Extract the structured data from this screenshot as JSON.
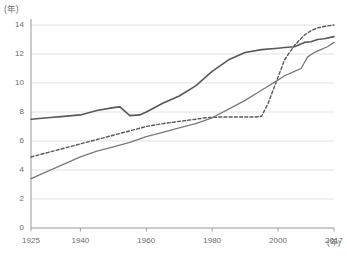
{
  "chart_data": {
    "type": "line",
    "title": "",
    "subtitle": "",
    "xlabel": "(年)",
    "ylabel": "(年)",
    "y_unit_label": "(年)",
    "x_unit_label": "(年)",
    "xlim": [
      1925,
      2017
    ],
    "ylim": [
      0,
      14
    ],
    "grid": true,
    "grid_axis": "y",
    "legend": null,
    "legend_position": "none",
    "yticks": [
      0,
      2,
      4,
      6,
      8,
      10,
      12,
      14
    ],
    "ytick_labels": [
      "0",
      "2",
      "4",
      "6",
      "8",
      "10",
      "12",
      "14"
    ],
    "xticks": [
      1925,
      1940,
      1960,
      1980,
      2000,
      2017
    ],
    "xtick_labels": [
      "1925",
      "1940",
      "1960",
      "1980",
      "2000",
      "2017"
    ],
    "colors": {
      "series_upper_solid": "#595959",
      "series_dashed": "#595959",
      "series_lower_solid": "#7a7a7a",
      "grid": "#d9d9d9",
      "axis": "#8c8c8c",
      "text": "#6b6b6b"
    },
    "series": [
      {
        "name": "upper-solid",
        "style": "solid",
        "color": "#595959",
        "width": 1.6,
        "x": [
          1925,
          1930,
          1935,
          1940,
          1945,
          1950,
          1952,
          1955,
          1958,
          1960,
          1965,
          1970,
          1975,
          1980,
          1985,
          1990,
          1995,
          2000,
          2002,
          2005,
          2008,
          2010,
          2012,
          2014,
          2017
        ],
        "values": [
          7.5,
          7.6,
          7.7,
          7.8,
          8.1,
          8.3,
          8.35,
          7.75,
          7.8,
          8.0,
          8.6,
          9.1,
          9.8,
          10.8,
          11.6,
          12.1,
          12.3,
          12.4,
          12.45,
          12.5,
          12.8,
          12.85,
          13.0,
          13.05,
          13.2
        ]
      },
      {
        "name": "dashed",
        "style": "dashed",
        "color": "#595959",
        "width": 1.4,
        "x": [
          1925,
          1930,
          1935,
          1940,
          1945,
          1950,
          1955,
          1960,
          1965,
          1970,
          1975,
          1978,
          1982,
          1985,
          1990,
          1993,
          1995,
          1997,
          2000,
          2002,
          2005,
          2008,
          2010,
          2012,
          2014,
          2017
        ],
        "values": [
          4.9,
          5.2,
          5.5,
          5.8,
          6.1,
          6.4,
          6.7,
          7.0,
          7.2,
          7.35,
          7.5,
          7.6,
          7.65,
          7.65,
          7.65,
          7.65,
          7.7,
          8.6,
          10.4,
          11.6,
          12.6,
          13.3,
          13.6,
          13.8,
          13.9,
          14.0
        ]
      },
      {
        "name": "lower-solid",
        "style": "solid",
        "color": "#7a7a7a",
        "width": 1.3,
        "x": [
          1925,
          1930,
          1935,
          1940,
          1945,
          1950,
          1955,
          1960,
          1965,
          1970,
          1975,
          1980,
          1985,
          1990,
          1995,
          2000,
          2002,
          2005,
          2007,
          2009,
          2011,
          2013,
          2015,
          2017
        ],
        "values": [
          3.4,
          3.9,
          4.4,
          4.9,
          5.3,
          5.6,
          5.9,
          6.3,
          6.6,
          6.9,
          7.2,
          7.6,
          8.2,
          8.8,
          9.5,
          10.2,
          10.5,
          10.8,
          11.0,
          11.8,
          12.1,
          12.3,
          12.5,
          12.8
        ]
      }
    ]
  }
}
